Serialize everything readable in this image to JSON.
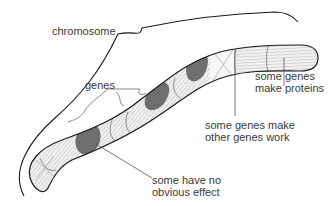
{
  "diagram": {
    "labels": {
      "chromosome": "chromosome",
      "genes": "genes",
      "make_proteins": "some genes\nmake proteins",
      "make_other_work": "some genes make\nother genes work",
      "no_effect": "some have no\nobvious effect"
    },
    "colors": {
      "outline": "#1a1a1a",
      "gene_dark": "#6e6e6e",
      "gene_light": "#f2f2f2",
      "stripe": "#8a8a8a",
      "leader_line": "#555555",
      "text": "#3a3a3a"
    }
  }
}
